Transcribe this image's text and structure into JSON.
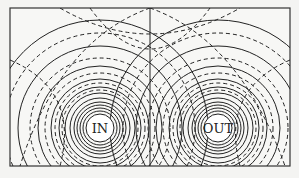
{
  "diagram": {
    "type": "field-lines",
    "labels": {
      "left_conductor": "IN",
      "right_conductor": "OUT"
    },
    "colors": {
      "ink": "#222222",
      "paper": "#f4f4f2",
      "conductor_fill": "#ffffff"
    },
    "line_styles": {
      "solid": "field lines",
      "dashed": "equipotential lines"
    }
  }
}
